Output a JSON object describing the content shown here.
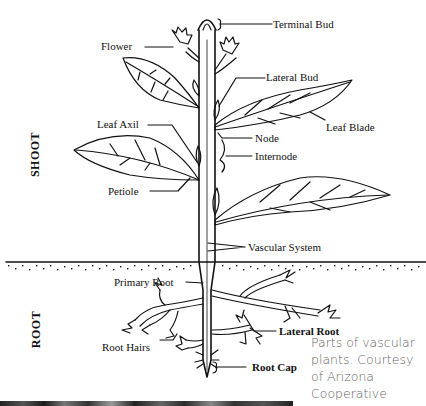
{
  "diagram": {
    "title": "Parts of vascular plants",
    "sections": [
      {
        "id": "shoot",
        "label": "SHOOT"
      },
      {
        "id": "root",
        "label": "ROOT"
      }
    ],
    "labels": {
      "terminal_bud": "Terminal Bud",
      "flower": "Flower",
      "lateral_bud": "Lateral Bud",
      "leaf_axil": "Leaf Axil",
      "leaf_blade": "Leaf Blade",
      "node": "Node",
      "internode": "Internode",
      "petiole": "Petiole",
      "vascular_system": "Vascular System",
      "primary_root": "Primary Root",
      "lateral_root": "Lateral Root",
      "root_hairs": "Root Hairs",
      "root_cap": "Root Cap"
    }
  },
  "caption": {
    "text": "Parts of vascular plants. Courtesy of Arizona Cooperative"
  },
  "colors": {
    "ink": "#111111",
    "caption": "#666666",
    "background": "#ffffff"
  }
}
